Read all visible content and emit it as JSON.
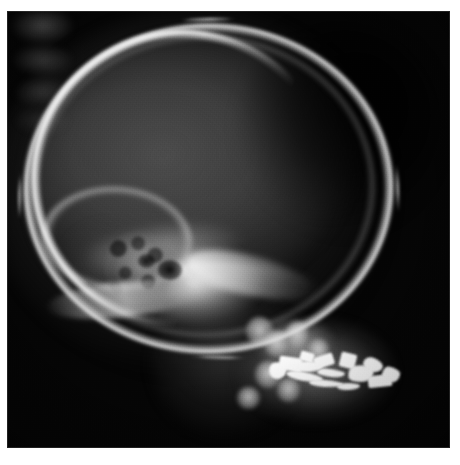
{
  "viewer": {
    "label": "radiograph-viewer",
    "background_color": "#ffffff",
    "width_px": 460,
    "height_px": 465
  },
  "image": {
    "name": "lateral-skull-radiograph",
    "modality": "X-ray",
    "projection": "Lateral",
    "body_part": "Skull",
    "orientation": "Face to the left, occiput to the right",
    "film_area": {
      "left_px": 7,
      "top_px": 11,
      "width_px": 443,
      "height_px": 437,
      "background_color": "#050505"
    },
    "palette": {
      "film_black": "#050505",
      "soft_tissue_gray": "#4a4a4a",
      "cranial_vault_gray": "#3c3c3c",
      "bone_light_gray": "#b4b4b4",
      "cortical_bright": "#eeeeee",
      "amalgam_white": "#fbfbfb",
      "page_white": "#fefefe"
    }
  },
  "anatomy": [
    {
      "id": "calvarium-outline",
      "label": "Calvarial outer table",
      "brightness": "bright"
    },
    {
      "id": "frontal-arc",
      "label": "Fronto-parietal cortical arc",
      "brightness": "very bright"
    },
    {
      "id": "inner-table",
      "label": "Inner table of skull",
      "brightness": "faint"
    },
    {
      "id": "cranial-vault",
      "label": "Cranial vault / brain shadow",
      "brightness": "mid gray"
    },
    {
      "id": "occipital-shadow",
      "label": "Posterior occipital region",
      "brightness": "dark"
    },
    {
      "id": "sphenoid-ridge",
      "label": "Sphenoid ridge",
      "brightness": "mid"
    },
    {
      "id": "sella-turcica",
      "label": "Sella turcica",
      "brightness": "dark lucency"
    },
    {
      "id": "petrous-temporal",
      "label": "Petrous temporal bone",
      "brightness": "very bright"
    },
    {
      "id": "mastoid-air-cells",
      "label": "Mastoid air cells",
      "brightness": "mottled"
    },
    {
      "id": "clivus",
      "label": "Clivus / skull base",
      "brightness": "bright band"
    },
    {
      "id": "posterior-fossa",
      "label": "Posterior cranial fossa",
      "brightness": "mid"
    },
    {
      "id": "cervical-spine",
      "label": "Upper cervical vertebrae",
      "brightness": "mid"
    },
    {
      "id": "mandible",
      "label": "Mandible body and ramus",
      "brightness": "mid"
    },
    {
      "id": "maxilla",
      "label": "Maxilla / upper dental arch",
      "brightness": "mid bright"
    },
    {
      "id": "dental-amalgam",
      "label": "Dental amalgam restorations",
      "brightness": "saturated white"
    }
  ],
  "dental_amalgam_fragments": [
    {
      "x_pct": 2,
      "y_pct": 26,
      "w_pct": 13,
      "h_pct": 30,
      "rot_deg": -12
    },
    {
      "x_pct": 9,
      "y_pct": 16,
      "w_pct": 16,
      "h_pct": 24,
      "rot_deg": 8
    },
    {
      "x_pct": 18,
      "y_pct": 24,
      "w_pct": 22,
      "h_pct": 20,
      "rot_deg": -4
    },
    {
      "x_pct": 14,
      "y_pct": 44,
      "w_pct": 26,
      "h_pct": 16,
      "rot_deg": 10
    },
    {
      "x_pct": 34,
      "y_pct": 14,
      "w_pct": 14,
      "h_pct": 22,
      "rot_deg": -18
    },
    {
      "x_pct": 36,
      "y_pct": 38,
      "w_pct": 20,
      "h_pct": 14,
      "rot_deg": 6
    },
    {
      "x_pct": 30,
      "y_pct": 58,
      "w_pct": 24,
      "h_pct": 13,
      "rot_deg": 4
    },
    {
      "x_pct": 52,
      "y_pct": 10,
      "w_pct": 11,
      "h_pct": 26,
      "rot_deg": 14
    },
    {
      "x_pct": 58,
      "y_pct": 30,
      "w_pct": 18,
      "h_pct": 30,
      "rot_deg": -8
    },
    {
      "x_pct": 68,
      "y_pct": 18,
      "w_pct": 14,
      "h_pct": 24,
      "rot_deg": 20
    },
    {
      "x_pct": 72,
      "y_pct": 48,
      "w_pct": 17,
      "h_pct": 22,
      "rot_deg": -6
    },
    {
      "x_pct": 82,
      "y_pct": 34,
      "w_pct": 13,
      "h_pct": 26,
      "rot_deg": 10
    },
    {
      "x_pct": 50,
      "y_pct": 62,
      "w_pct": 16,
      "h_pct": 12,
      "rot_deg": -2
    },
    {
      "x_pct": 24,
      "y_pct": 8,
      "w_pct": 10,
      "h_pct": 18,
      "rot_deg": 16
    }
  ],
  "tooth_crowns": [
    {
      "x_pct": 54,
      "y_pct": 70,
      "w_pct": 6.0,
      "h_pct": 6.5
    },
    {
      "x_pct": 58,
      "y_pct": 73,
      "w_pct": 5.4,
      "h_pct": 6.0
    },
    {
      "x_pct": 56,
      "y_pct": 80,
      "w_pct": 5.8,
      "h_pct": 6.2
    },
    {
      "x_pct": 61,
      "y_pct": 84,
      "w_pct": 5.2,
      "h_pct": 5.4
    },
    {
      "x_pct": 63,
      "y_pct": 71,
      "w_pct": 5.0,
      "h_pct": 5.6
    },
    {
      "x_pct": 68,
      "y_pct": 75,
      "w_pct": 4.6,
      "h_pct": 5.0
    },
    {
      "x_pct": 52,
      "y_pct": 86,
      "w_pct": 5.0,
      "h_pct": 5.0
    }
  ]
}
